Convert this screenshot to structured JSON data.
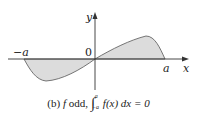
{
  "diagram": {
    "labels": {
      "y_axis": "y",
      "x_axis": "x",
      "origin": "0",
      "neg_a": "−a",
      "pos_a": "a"
    },
    "caption": {
      "prefix": "(b) ",
      "f": "f",
      "odd_text": " odd, ",
      "integral": "∫",
      "upper": "a",
      "lower": "−a",
      "integrand": "f(x) dx = 0"
    },
    "colors": {
      "fill": "#d9d9d9",
      "curve": "#555555",
      "axis": "#333333"
    }
  }
}
